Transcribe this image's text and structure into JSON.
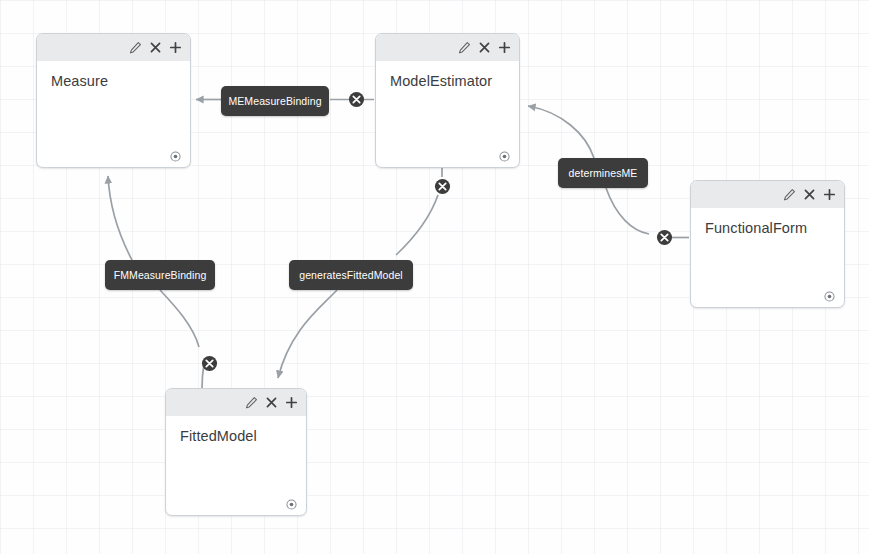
{
  "diagram": {
    "type": "entity-relationship-editor",
    "colors": {
      "node_border": "#cdd2d8",
      "node_header": "#e9eaec",
      "node_body": "#ffffff",
      "label_background": "#3c3c3c",
      "label_text": "#ffffff",
      "edge_stroke": "#9aa0a6",
      "marker_fill": "#3c3c3c",
      "canvas_background": "#fefefe"
    },
    "node_icons": [
      {
        "name": "edit-pencil-icon",
        "glyph": "pencil"
      },
      {
        "name": "close-icon",
        "glyph": "x"
      },
      {
        "name": "add-icon",
        "glyph": "plus"
      }
    ],
    "anchor_icon": {
      "name": "anchor-target-icon",
      "glyph": "dot-in-circle"
    },
    "nodes": [
      {
        "id": "measure",
        "title": "Measure",
        "x": 36,
        "y": 33,
        "w": 155,
        "h": 135
      },
      {
        "id": "model_estimator",
        "title": "ModelEstimator",
        "x": 375,
        "y": 33,
        "w": 145,
        "h": 135
      },
      {
        "id": "functional_form",
        "title": "FunctionalForm",
        "x": 690,
        "y": 180,
        "w": 155,
        "h": 128
      },
      {
        "id": "fitted_model",
        "title": "FittedModel",
        "x": 165,
        "y": 388,
        "w": 142,
        "h": 128
      }
    ],
    "edge_labels": [
      {
        "id": "me_measure_binding",
        "text": "MEMeasureBinding",
        "x": 221,
        "y": 86,
        "w": 108
      },
      {
        "id": "determines_me",
        "text": "determinesME",
        "x": 558,
        "y": 158,
        "w": 90
      },
      {
        "id": "fm_measure_binding",
        "text": "FMMeasureBinding",
        "x": 105,
        "y": 260,
        "w": 110
      },
      {
        "id": "generates_fitted_model",
        "text": "generatesFittedModel",
        "x": 289,
        "y": 260,
        "w": 124
      }
    ],
    "junction_markers": [
      {
        "id": "marker-me-measure",
        "x": 348,
        "y": 91
      },
      {
        "id": "marker-generates",
        "x": 434,
        "y": 178
      },
      {
        "id": "marker-determines",
        "x": 656,
        "y": 229
      },
      {
        "id": "marker-fm-measure",
        "x": 201,
        "y": 355
      }
    ],
    "edges": [
      {
        "id": "edge-me-measure-binding",
        "from": "model_estimator",
        "to": "measure",
        "label": "MEMeasureBinding"
      },
      {
        "id": "edge-determines-me",
        "from": "functional_form",
        "to": "model_estimator",
        "label": "determinesME"
      },
      {
        "id": "edge-fm-measure-binding",
        "from": "fitted_model",
        "to": "measure",
        "label": "FMMeasureBinding"
      },
      {
        "id": "edge-generates-fitted-model",
        "from": "model_estimator",
        "to": "fitted_model",
        "label": "generatesFittedModel"
      }
    ]
  }
}
